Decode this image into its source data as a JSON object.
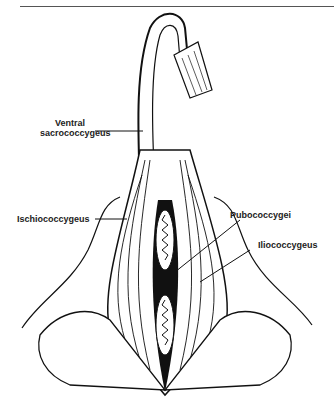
{
  "figure": {
    "labels": {
      "ventral_line1": "Ventral",
      "ventral_line2": "sacrococcygeus",
      "ischio": "Ischiococcygeus",
      "pubo": "Pubococcygei",
      "ilio": "Iliococcygeus"
    }
  }
}
